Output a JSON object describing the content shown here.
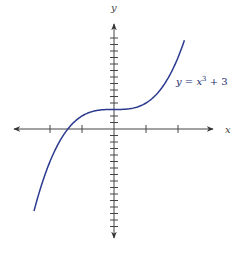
{
  "chart_data": {
    "type": "line",
    "title": "",
    "xlabel": "x",
    "ylabel": "y",
    "function": "y = x^3 + 3",
    "series": [
      {
        "name": "y = x³ + 3",
        "color": "#2b3a8f",
        "x": [
          -2.5,
          -2.0,
          -1.5,
          -1.44,
          -1.0,
          -0.5,
          0,
          0.5,
          1.0,
          1.5,
          2.0,
          2.2
        ],
        "y": [
          -12.63,
          -5,
          -0.38,
          0,
          2,
          2.88,
          3,
          3.13,
          4,
          6.38,
          11,
          13.65
        ]
      }
    ],
    "annotations": [
      {
        "text": "y = x³ + 3",
        "x": 1.9,
        "y": 7.3
      }
    ],
    "x_ticks": [
      -2,
      -1,
      1,
      2
    ],
    "y_ticks_spacing": 1,
    "xlim": [
      -3.2,
      3.1
    ],
    "ylim": [
      -17,
      16
    ],
    "grid": false,
    "legend": "none"
  },
  "labels": {
    "x_axis": "x",
    "y_axis": "y",
    "curve_prefix": "y = x",
    "curve_exp": "3",
    "curve_suffix": " + 3"
  },
  "colors": {
    "curve": "#2b3a8f",
    "axis": "#333333"
  }
}
